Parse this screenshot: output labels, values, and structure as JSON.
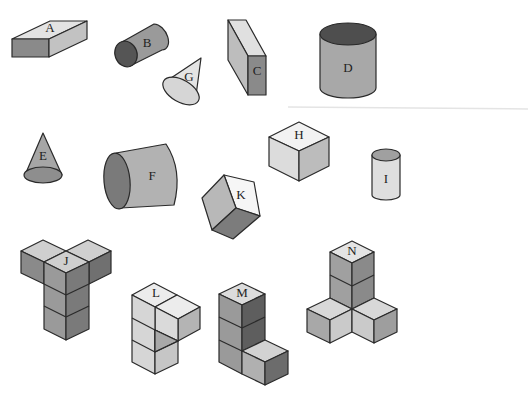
{
  "diagram": {
    "title": "",
    "shapes": [
      {
        "id": "A",
        "label": "A",
        "kind": "rectangular prism (flat box)"
      },
      {
        "id": "B",
        "label": "B",
        "kind": "cylinder (lying)"
      },
      {
        "id": "C",
        "label": "C",
        "kind": "rectangular prism (tall slab)"
      },
      {
        "id": "D",
        "label": "D",
        "kind": "cylinder (upright, wide)"
      },
      {
        "id": "E",
        "label": "E",
        "kind": "cone (upright)"
      },
      {
        "id": "F",
        "label": "F",
        "kind": "cylinder (lying, large)"
      },
      {
        "id": "G",
        "label": "G",
        "kind": "cone (tilted)"
      },
      {
        "id": "H",
        "label": "H",
        "kind": "cube"
      },
      {
        "id": "I",
        "label": "I",
        "kind": "cylinder (upright, narrow)"
      },
      {
        "id": "J",
        "label": "J",
        "kind": "cube assembly (5 cubes, T-shape)"
      },
      {
        "id": "K",
        "label": "K",
        "kind": "cube (tilted)"
      },
      {
        "id": "L",
        "label": "L",
        "kind": "cube assembly (4 cubes)"
      },
      {
        "id": "M",
        "label": "M",
        "kind": "cube assembly (4 cubes, L-shape)"
      },
      {
        "id": "N",
        "label": "N",
        "kind": "cube assembly (5 cubes)"
      }
    ],
    "colors": {
      "light": "#e6e6e6",
      "mid": "#b4b4b4",
      "dark": "#8c8c8c",
      "darker": "#6e6e6e",
      "outline": "#2a2a2a"
    }
  }
}
